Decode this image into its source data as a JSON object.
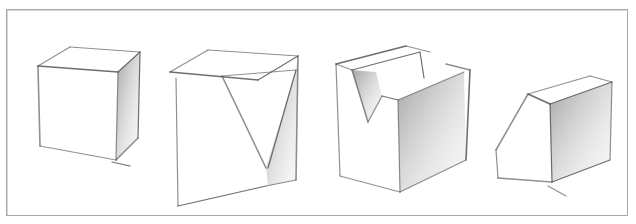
{
  "figure": {
    "background": "#ffffff",
    "frame_color": "#a8a8a8",
    "line_color": "#555555",
    "shade_color": "#6a6a6a"
  },
  "cubes": [
    {
      "name": "plain-cube",
      "lines": [
        [
          38,
          66,
          118,
          72
        ],
        [
          38,
          66,
          70,
          47
        ],
        [
          70,
          47,
          140,
          52
        ],
        [
          118,
          72,
          140,
          52
        ],
        [
          38,
          66,
          40,
          146
        ],
        [
          118,
          72,
          116,
          160
        ],
        [
          140,
          52,
          138,
          138
        ],
        [
          40,
          146,
          116,
          160
        ],
        [
          116,
          160,
          138,
          138
        ],
        [
          112,
          162,
          130,
          166
        ]
      ],
      "shade": [
        [
          118,
          72,
          140,
          52,
          138,
          138,
          116,
          160
        ]
      ]
    },
    {
      "name": "corner-cut-cube",
      "lines": [
        [
          170,
          72,
          258,
          80
        ],
        [
          170,
          72,
          208,
          50
        ],
        [
          208,
          50,
          298,
          56
        ],
        [
          258,
          80,
          298,
          56
        ],
        [
          222,
          76,
          266,
          168
        ],
        [
          222,
          76,
          296,
          70
        ],
        [
          296,
          70,
          268,
          168
        ],
        [
          176,
          78,
          178,
          206
        ],
        [
          298,
          56,
          296,
          180
        ],
        [
          178,
          206,
          266,
          186
        ],
        [
          266,
          168,
          266,
          186
        ],
        [
          266,
          186,
          296,
          180
        ]
      ],
      "shade": [
        [
          296,
          70,
          298,
          56,
          296,
          180,
          268,
          186,
          266,
          168
        ]
      ]
    },
    {
      "name": "v-notch-cube",
      "lines": [
        [
          336,
          64,
          406,
          46
        ],
        [
          406,
          46,
          430,
          52
        ],
        [
          336,
          64,
          352,
          70
        ],
        [
          352,
          70,
          420,
          52
        ],
        [
          352,
          70,
          368,
          122
        ],
        [
          368,
          122,
          382,
          96
        ],
        [
          382,
          96,
          398,
          100
        ],
        [
          398,
          100,
          464,
          72
        ],
        [
          446,
          64,
          470,
          70
        ],
        [
          420,
          52,
          424,
          78
        ],
        [
          336,
          64,
          340,
          176
        ],
        [
          398,
          100,
          400,
          192
        ],
        [
          470,
          70,
          466,
          160
        ],
        [
          340,
          176,
          400,
          192
        ],
        [
          400,
          192,
          466,
          160
        ]
      ],
      "shade": [
        [
          352,
          70,
          368,
          122,
          382,
          96,
          376,
          72
        ],
        [
          398,
          100,
          464,
          72,
          466,
          160,
          400,
          192
        ]
      ]
    },
    {
      "name": "chamfered-cube",
      "lines": [
        [
          528,
          94,
          550,
          104
        ],
        [
          528,
          94,
          590,
          76
        ],
        [
          590,
          76,
          612,
          82
        ],
        [
          550,
          104,
          612,
          82
        ],
        [
          528,
          94,
          496,
          150
        ],
        [
          496,
          150,
          498,
          178
        ],
        [
          550,
          104,
          552,
          182
        ],
        [
          612,
          82,
          610,
          160
        ],
        [
          498,
          178,
          552,
          182
        ],
        [
          552,
          182,
          610,
          160
        ],
        [
          548,
          186,
          566,
          196
        ]
      ],
      "shade": [
        [
          550,
          104,
          612,
          82,
          610,
          160,
          552,
          182
        ]
      ]
    }
  ]
}
